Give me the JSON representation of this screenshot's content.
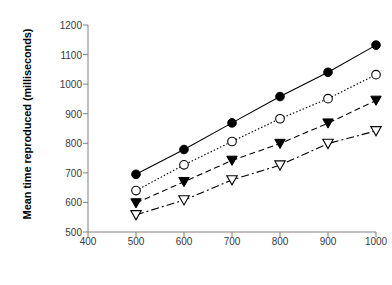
{
  "chart_data": {
    "type": "line",
    "title": "",
    "xlabel": "Sample time (milliseconds)",
    "ylabel": "Mean time reproduced (milliseconds)",
    "x": [
      500,
      600,
      700,
      800,
      900,
      1000
    ],
    "xlim": [
      400,
      1000
    ],
    "ylim": [
      500,
      1200
    ],
    "xticks": [
      "400",
      "500",
      "600",
      "700",
      "800",
      "900",
      "1000"
    ],
    "yticks": [
      "500",
      "600",
      "700",
      "800",
      "900",
      "1000",
      "1100",
      "1200"
    ],
    "grid": false,
    "legend": "none",
    "series": [
      {
        "name": "series-1",
        "marker": "filled-circle",
        "line_style": "solid",
        "color": "#000000",
        "values": [
          695,
          779,
          869,
          958,
          1040,
          1132
        ]
      },
      {
        "name": "series-2",
        "marker": "open-circle",
        "line_style": "dotted",
        "color": "#000000",
        "values": [
          640,
          727,
          806,
          883,
          951,
          1032
        ]
      },
      {
        "name": "series-3",
        "marker": "filled-triangle-down",
        "line_style": "dashed",
        "color": "#000000",
        "values": [
          598,
          670,
          742,
          799,
          868,
          945
        ]
      },
      {
        "name": "series-4",
        "marker": "open-triangle-down",
        "line_style": "dash-dot",
        "color": "#000000",
        "values": [
          558,
          608,
          676,
          726,
          799,
          842
        ]
      }
    ]
  }
}
